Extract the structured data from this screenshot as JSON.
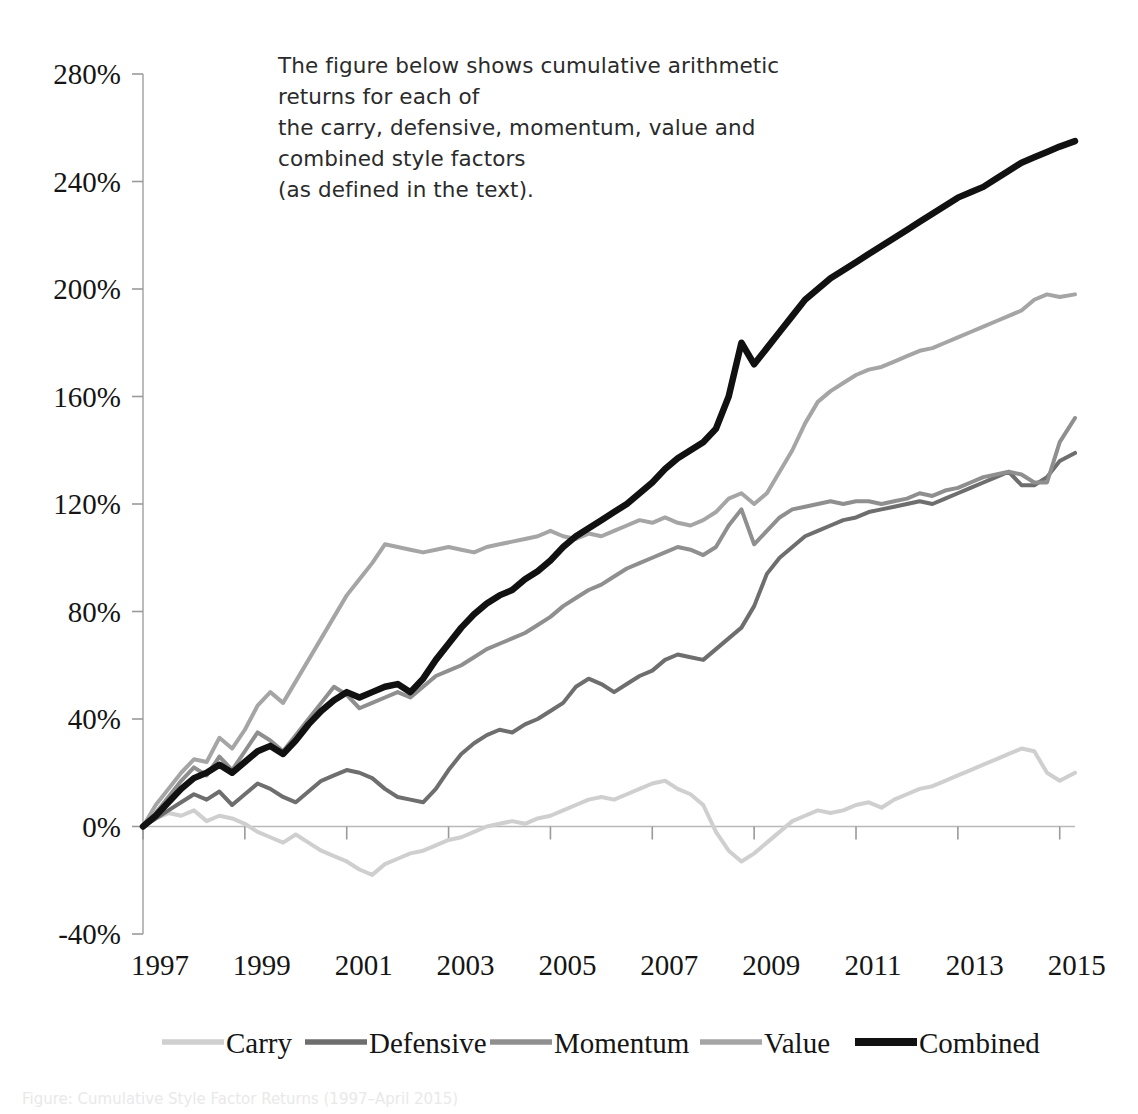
{
  "caption": {
    "text": "The figure below shows cumulative arithmetic returns for each of\nthe carry, defensive, momentum, value and combined style factors\n(as defined in the text)."
  },
  "bottom_note": {
    "text": "Figure: Cumulative Style Factor Returns (1997–April 2015)"
  },
  "chart_data": {
    "type": "line",
    "title": "",
    "subtitle": "",
    "xlabel": "",
    "ylabel": "",
    "grid": false,
    "legend_position": "bottom",
    "xlim": [
      1997,
      2015.3
    ],
    "ylim": [
      -40,
      280
    ],
    "ytick_labels": [
      "280%",
      "240%",
      "200%",
      "160%",
      "120%",
      "80%",
      "40%",
      "0%",
      "-40%"
    ],
    "ytick_values": [
      280,
      240,
      200,
      160,
      120,
      80,
      40,
      0,
      -40
    ],
    "xtick_labels": [
      "1997",
      "1999",
      "2001",
      "2003",
      "2005",
      "2007",
      "2009",
      "2011",
      "2013",
      "2015"
    ],
    "xtick_values": [
      1997,
      1999,
      2001,
      2003,
      2005,
      2007,
      2009,
      2011,
      2013,
      2015
    ],
    "colors": {
      "Carry": "#cfcfcf",
      "Defensive": "#6e6e6e",
      "Momentum": "#8f8f8f",
      "Value": "#a5a5a5",
      "Combined": "#111111"
    },
    "linewidths": {
      "Carry": 4.0,
      "Defensive": 4.0,
      "Momentum": 4.0,
      "Value": 4.0,
      "Combined": 6.5
    },
    "x": [
      1997.0,
      1997.25,
      1997.5,
      1997.75,
      1998.0,
      1998.25,
      1998.5,
      1998.75,
      1999.0,
      1999.25,
      1999.5,
      1999.75,
      2000.0,
      2000.25,
      2000.5,
      2000.75,
      2001.0,
      2001.25,
      2001.5,
      2001.75,
      2002.0,
      2002.25,
      2002.5,
      2002.75,
      2003.0,
      2003.25,
      2003.5,
      2003.75,
      2004.0,
      2004.25,
      2004.5,
      2004.75,
      2005.0,
      2005.25,
      2005.5,
      2005.75,
      2006.0,
      2006.25,
      2006.5,
      2006.75,
      2007.0,
      2007.25,
      2007.5,
      2007.75,
      2008.0,
      2008.25,
      2008.5,
      2008.75,
      2009.0,
      2009.25,
      2009.5,
      2009.75,
      2010.0,
      2010.25,
      2010.5,
      2010.75,
      2011.0,
      2011.25,
      2011.5,
      2011.75,
      2012.0,
      2012.25,
      2012.5,
      2012.75,
      2013.0,
      2013.25,
      2013.5,
      2013.75,
      2014.0,
      2014.25,
      2014.5,
      2014.75,
      2015.0,
      2015.3
    ],
    "series": [
      {
        "name": "Carry",
        "values": [
          0,
          3,
          5,
          4,
          6,
          2,
          4,
          3,
          1,
          -2,
          -4,
          -6,
          -3,
          -6,
          -9,
          -11,
          -13,
          -16,
          -18,
          -14,
          -12,
          -10,
          -9,
          -7,
          -5,
          -4,
          -2,
          0,
          1,
          2,
          1,
          3,
          4,
          6,
          8,
          10,
          11,
          10,
          12,
          14,
          16,
          17,
          14,
          12,
          8,
          -2,
          -9,
          -13,
          -10,
          -6,
          -2,
          2,
          4,
          6,
          5,
          6,
          8,
          9,
          7,
          10,
          12,
          14,
          15,
          17,
          19,
          21,
          23,
          25,
          27,
          29,
          28,
          20,
          17,
          20
        ]
      },
      {
        "name": "Defensive",
        "values": [
          0,
          3,
          6,
          9,
          12,
          10,
          13,
          8,
          12,
          16,
          14,
          11,
          9,
          13,
          17,
          19,
          21,
          20,
          18,
          14,
          11,
          10,
          9,
          14,
          21,
          27,
          31,
          34,
          36,
          35,
          38,
          40,
          43,
          46,
          52,
          55,
          53,
          50,
          53,
          56,
          58,
          62,
          64,
          63,
          62,
          66,
          70,
          74,
          82,
          94,
          100,
          104,
          108,
          110,
          112,
          114,
          115,
          117,
          118,
          119,
          120,
          121,
          120,
          122,
          124,
          126,
          128,
          130,
          132,
          127,
          127,
          130,
          136,
          139
        ]
      },
      {
        "name": "Momentum",
        "values": [
          0,
          5,
          11,
          17,
          22,
          19,
          26,
          21,
          28,
          35,
          32,
          28,
          34,
          40,
          46,
          52,
          49,
          44,
          46,
          48,
          50,
          48,
          52,
          56,
          58,
          60,
          63,
          66,
          68,
          70,
          72,
          75,
          78,
          82,
          85,
          88,
          90,
          93,
          96,
          98,
          100,
          102,
          104,
          103,
          101,
          104,
          112,
          118,
          105,
          110,
          115,
          118,
          119,
          120,
          121,
          120,
          121,
          121,
          120,
          121,
          122,
          124,
          123,
          125,
          126,
          128,
          130,
          131,
          132,
          131,
          128,
          128,
          143,
          152
        ]
      },
      {
        "name": "Value",
        "values": [
          0,
          8,
          14,
          20,
          25,
          24,
          33,
          29,
          36,
          45,
          50,
          46,
          54,
          62,
          70,
          78,
          86,
          92,
          98,
          105,
          104,
          103,
          102,
          103,
          104,
          103,
          102,
          104,
          105,
          106,
          107,
          108,
          110,
          108,
          107,
          109,
          108,
          110,
          112,
          114,
          113,
          115,
          113,
          112,
          114,
          117,
          122,
          124,
          120,
          124,
          132,
          140,
          150,
          158,
          162,
          165,
          168,
          170,
          171,
          173,
          175,
          177,
          178,
          180,
          182,
          184,
          186,
          188,
          190,
          192,
          196,
          198,
          197,
          198
        ]
      },
      {
        "name": "Combined",
        "values": [
          0,
          4,
          9,
          14,
          18,
          20,
          23,
          20,
          24,
          28,
          30,
          27,
          32,
          38,
          43,
          47,
          50,
          48,
          50,
          52,
          53,
          50,
          55,
          62,
          68,
          74,
          79,
          83,
          86,
          88,
          92,
          95,
          99,
          104,
          108,
          111,
          114,
          117,
          120,
          124,
          128,
          133,
          137,
          140,
          143,
          148,
          160,
          180,
          172,
          178,
          184,
          190,
          196,
          200,
          204,
          207,
          210,
          213,
          216,
          219,
          222,
          225,
          228,
          231,
          234,
          236,
          238,
          241,
          244,
          247,
          249,
          251,
          253,
          255
        ]
      }
    ],
    "legend": [
      {
        "label": "Carry",
        "color": "#cfcfcf"
      },
      {
        "label": "Defensive",
        "color": "#6e6e6e"
      },
      {
        "label": "Momentum",
        "color": "#8f8f8f"
      },
      {
        "label": "Value",
        "color": "#a5a5a5"
      },
      {
        "label": "Combined",
        "color": "#111111"
      }
    ]
  }
}
